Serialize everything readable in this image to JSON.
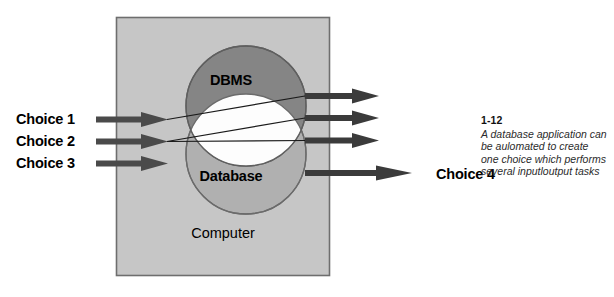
{
  "diagram": {
    "type": "venn-system-diagram",
    "title_text": "Computer",
    "container": {
      "label": "Computer",
      "fill_color": "#c6c6c6",
      "border_color": "#6e6e6e"
    },
    "sets": [
      {
        "name": "dbms-circle",
        "label": "DBMS",
        "fill_color": "#858585",
        "stroke_color": "#5f5f5f"
      },
      {
        "name": "database-circle",
        "label": "Database",
        "fill_color": "#b0b0b0",
        "stroke_color": "#6b6b6b"
      }
    ],
    "intersection": {
      "name": "overlap-lens",
      "fill_color": "#fdfdfd"
    },
    "inputs": {
      "arrow_color": "#4a4a4a",
      "items": [
        {
          "label": "Choice 1"
        },
        {
          "label": "Choice 2"
        },
        {
          "label": "Choice 3"
        }
      ]
    },
    "outputs": {
      "arrow_color": "#3b3b3b",
      "items": [
        {
          "label": ""
        },
        {
          "label": ""
        },
        {
          "label": ""
        },
        {
          "label": "Choice 4"
        }
      ]
    },
    "connector_lines": {
      "count": 3,
      "stroke_color": "#1a1a1a"
    }
  },
  "annotation": {
    "number": "1-12",
    "lines": [
      "A database application can",
      "be aulomated to create",
      "one choice which performs",
      "several inputloutput tasks"
    ]
  }
}
